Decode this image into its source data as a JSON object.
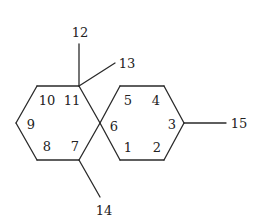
{
  "diagram": {
    "type": "chemical-structure",
    "stroke_color": "#2a2a2a",
    "label_color": "#222222",
    "atoms": [
      {
        "id": "C1",
        "x": 120,
        "y": 160
      },
      {
        "id": "C2",
        "x": 164,
        "y": 160
      },
      {
        "id": "C3",
        "x": 184,
        "y": 123
      },
      {
        "id": "C4",
        "x": 164,
        "y": 86
      },
      {
        "id": "C5",
        "x": 120,
        "y": 86
      },
      {
        "id": "C6",
        "x": 100,
        "y": 123
      },
      {
        "id": "C7",
        "x": 79,
        "y": 160
      },
      {
        "id": "C8",
        "x": 37,
        "y": 160
      },
      {
        "id": "C9",
        "x": 16,
        "y": 123
      },
      {
        "id": "C10",
        "x": 37,
        "y": 86
      },
      {
        "id": "C11",
        "x": 79,
        "y": 86
      },
      {
        "id": "C12",
        "x": 79,
        "y": 44
      },
      {
        "id": "C13",
        "x": 115,
        "y": 63
      },
      {
        "id": "C14",
        "x": 100,
        "y": 197
      },
      {
        "id": "C15",
        "x": 226,
        "y": 123
      }
    ],
    "bonds": [
      [
        "C1",
        "C2"
      ],
      [
        "C2",
        "C3"
      ],
      [
        "C3",
        "C4"
      ],
      [
        "C4",
        "C5"
      ],
      [
        "C5",
        "C6"
      ],
      [
        "C6",
        "C1"
      ],
      [
        "C6",
        "C7"
      ],
      [
        "C7",
        "C8"
      ],
      [
        "C8",
        "C9"
      ],
      [
        "C9",
        "C10"
      ],
      [
        "C10",
        "C11"
      ],
      [
        "C11",
        "C6"
      ],
      [
        "C11",
        "C12"
      ],
      [
        "C11",
        "C13"
      ],
      [
        "C7",
        "C14"
      ],
      [
        "C3",
        "C15"
      ]
    ],
    "labels": [
      {
        "text": "1",
        "x": 128,
        "y": 147
      },
      {
        "text": "2",
        "x": 157,
        "y": 147
      },
      {
        "text": "3",
        "x": 172,
        "y": 124
      },
      {
        "text": "4",
        "x": 156,
        "y": 100
      },
      {
        "text": "5",
        "x": 128,
        "y": 100
      },
      {
        "text": "6",
        "x": 114,
        "y": 126
      },
      {
        "text": "7",
        "x": 75,
        "y": 146
      },
      {
        "text": "8",
        "x": 47,
        "y": 146
      },
      {
        "text": "9",
        "x": 31,
        "y": 124
      },
      {
        "text": "10",
        "x": 47,
        "y": 100
      },
      {
        "text": "11",
        "x": 72,
        "y": 100
      },
      {
        "text": "12",
        "x": 80,
        "y": 32
      },
      {
        "text": "13",
        "x": 127,
        "y": 63
      },
      {
        "text": "14",
        "x": 104,
        "y": 210
      },
      {
        "text": "15",
        "x": 239,
        "y": 123
      }
    ]
  }
}
